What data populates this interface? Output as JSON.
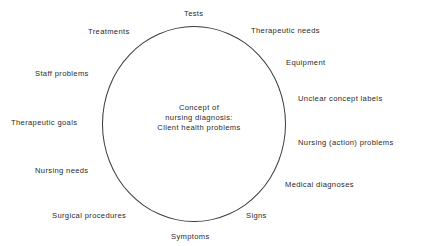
{
  "diagram": {
    "center": {
      "lines": [
        "Concept of",
        "nursing diagnosis:",
        "Client health problems"
      ]
    },
    "labels": [
      {
        "text": "Tests",
        "x": 184,
        "y": 10
      },
      {
        "text": "Treatments",
        "x": 88,
        "y": 28
      },
      {
        "text": "Therapeutic needs",
        "x": 251,
        "y": 27
      },
      {
        "text": "Equipment",
        "x": 286,
        "y": 59
      },
      {
        "text": "Staff problems",
        "x": 35,
        "y": 70
      },
      {
        "text": "Unclear concept labels",
        "x": 298,
        "y": 95
      },
      {
        "text": "Therapeutic goals",
        "x": 11,
        "y": 119
      },
      {
        "text": "Nursing (action) problems",
        "x": 298,
        "y": 139
      },
      {
        "text": "Nursing needs",
        "x": 35,
        "y": 167
      },
      {
        "text": "Medical diagnoses",
        "x": 285,
        "y": 181
      },
      {
        "text": "Surgical procedures",
        "x": 52,
        "y": 212
      },
      {
        "text": "Signs",
        "x": 246,
        "y": 212
      },
      {
        "text": "Symptoms",
        "x": 171,
        "y": 233
      }
    ]
  }
}
